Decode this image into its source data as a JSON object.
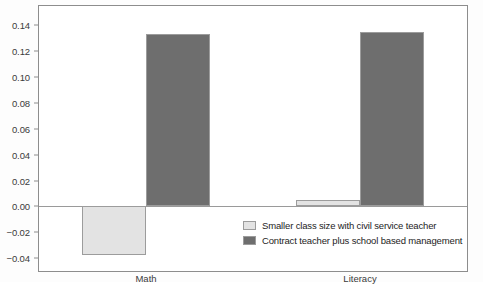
{
  "chart_data": {
    "type": "bar",
    "title": "",
    "subtitle": "",
    "xlabel": "",
    "ylabel": "",
    "categories": [
      "Math",
      "Literacy"
    ],
    "series": [
      {
        "name": "Smaller class size with civil service teacher",
        "color": "#e3e3e3",
        "values": [
          -0.038,
          0.005
        ]
      },
      {
        "name": "Contract teacher plus school based management",
        "color": "#6e6e6e",
        "values": [
          0.133,
          0.135
        ]
      }
    ],
    "ylim": [
      -0.05,
      0.155
    ],
    "y_ticks": [
      -0.04,
      -0.02,
      0.0,
      0.02,
      0.04,
      0.06,
      0.08,
      0.1,
      0.12,
      0.14
    ],
    "y_tick_labels": [
      "−0.04",
      "−0.02",
      "0.00",
      "0.02",
      "0.04",
      "0.06",
      "0.08",
      "0.10",
      "0.12",
      "0.14"
    ],
    "grid": false,
    "legend_position": "inside-lower-right",
    "zero_line": true,
    "frame": true,
    "colors": {
      "series_light": "#e3e3e3",
      "series_dark": "#6e6e6e",
      "bar_border": "#9c9c9c",
      "axis": "#8d8d8d",
      "zero_line": "#9a9a9a",
      "text": "#3b3b3b",
      "legend_text": "#1d1d1d",
      "background": "#ffffff"
    }
  },
  "legend": {
    "items": [
      {
        "label": "Smaller class size with civil service teacher",
        "color": "#e3e3e3"
      },
      {
        "label": "Contract teacher plus school based management",
        "color": "#6e6e6e"
      }
    ]
  }
}
